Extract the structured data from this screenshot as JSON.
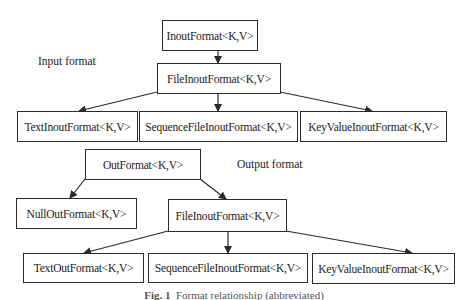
{
  "diagram": {
    "input_section": {
      "label": "Input format",
      "root": "InoutFormat<K,V>",
      "middle": "FileInoutFormat<K,V>",
      "leaves": [
        "TextInoutFormat<K,V>",
        "SequenceFileInoutFormat<K,V>",
        "KeyValueInoutFormat<K,V>"
      ]
    },
    "output_section": {
      "label": "Output format",
      "root": "OutFormat<K,V>",
      "children": [
        "NullOutFormat<K,V>",
        "FileInoutFormat<K,V>"
      ],
      "leaves": [
        "TextOutFormat<K,V>",
        "SequenceFileInoutFormat<K,V>",
        "KeyValueInoutFormat<K,V>"
      ]
    },
    "caption": {
      "prefix": "Fig. 1",
      "text": "Format relationship (abbreviated)"
    },
    "colors": {
      "stroke": "#2a2a2a",
      "background": "#ffffff",
      "text": "#222222"
    }
  }
}
